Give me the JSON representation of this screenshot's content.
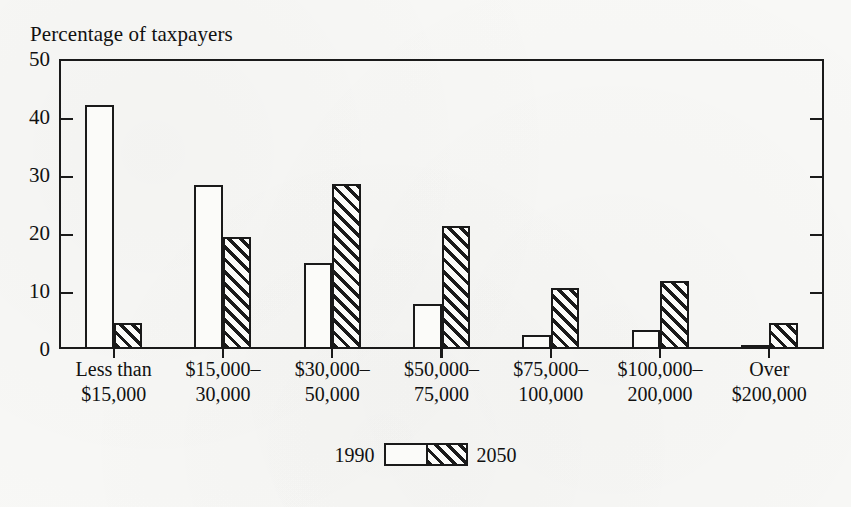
{
  "chart_data": {
    "type": "bar",
    "title": "Percentage of taxpayers",
    "xlabel": "",
    "ylabel": "",
    "ylim": [
      0,
      50
    ],
    "yticks": [
      0,
      10,
      20,
      30,
      40,
      50
    ],
    "grid": false,
    "legend_position": "bottom-center",
    "categories": [
      "Less than $15,000",
      "$15,000–30,000",
      "$30,000–50,000",
      "$50,000–75,000",
      "$75,000–100,000",
      "$100,000–200,000",
      "Over $200,000"
    ],
    "category_lines": [
      {
        "line1": "Less than",
        "line2": "$15,000"
      },
      {
        "line1": "$15,000–",
        "line2": "30,000"
      },
      {
        "line1": "$30,000–",
        "line2": "50,000"
      },
      {
        "line1": "$50,000–",
        "line2": "75,000"
      },
      {
        "line1": "$75,000–",
        "line2": "100,000"
      },
      {
        "line1": "$100,000–",
        "line2": "200,000"
      },
      {
        "line1": "Over",
        "line2": "$200,000"
      }
    ],
    "series": [
      {
        "name": "1990",
        "style": "open",
        "values": [
          42.0,
          28.2,
          14.8,
          7.8,
          2.5,
          3.3,
          0.5
        ]
      },
      {
        "name": "2050",
        "style": "hatched",
        "values": [
          4.5,
          19.3,
          28.4,
          21.2,
          10.6,
          11.8,
          4.5
        ]
      }
    ]
  },
  "legend": {
    "left_label": "1990",
    "right_label": "2050"
  },
  "colors": {
    "ink": "#1a1a1a",
    "paper": "#f8f8f6",
    "bar_fill": "#fbfbf9"
  }
}
